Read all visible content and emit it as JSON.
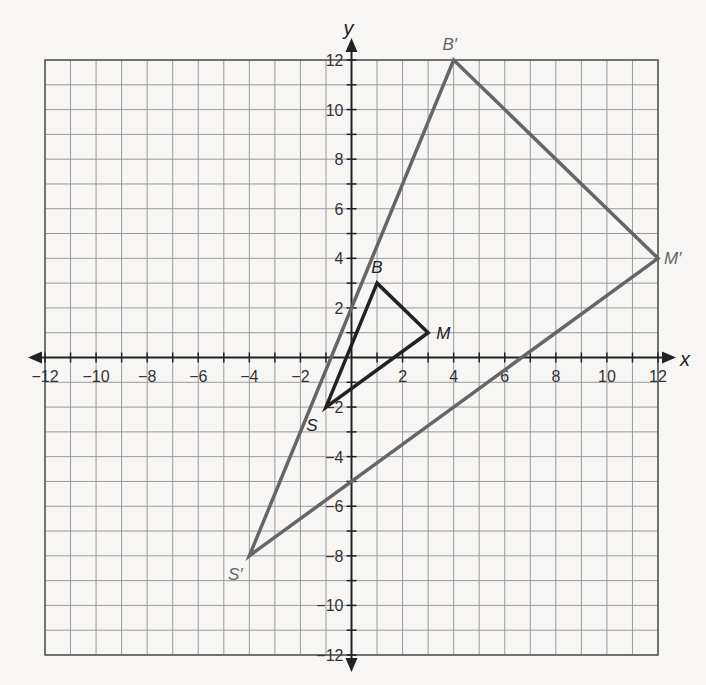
{
  "chart_data": {
    "type": "scatter",
    "title": "",
    "xlabel": "x",
    "ylabel": "y",
    "xlim": [
      -12,
      12
    ],
    "ylim": [
      -12,
      12
    ],
    "grid": true,
    "xticks": [
      -12,
      -10,
      -8,
      -6,
      -4,
      -2,
      2,
      4,
      6,
      8,
      10,
      12
    ],
    "yticks": [
      -12,
      -10,
      -8,
      -6,
      -4,
      -2,
      2,
      4,
      6,
      8,
      10,
      12
    ],
    "series": [
      {
        "name": "Triangle SBM (pre-image)",
        "color": "#222222",
        "points": [
          {
            "label": "B",
            "x": 1,
            "y": 3
          },
          {
            "label": "M",
            "x": 3,
            "y": 1
          },
          {
            "label": "S",
            "x": -1,
            "y": -2
          }
        ]
      },
      {
        "name": "Triangle S'B'M' (image, dilation factor 4 about origin)",
        "color": "#666666",
        "points": [
          {
            "label": "B′",
            "x": 4,
            "y": 12
          },
          {
            "label": "M′",
            "x": 12,
            "y": 4
          },
          {
            "label": "S′",
            "x": -4,
            "y": -8
          }
        ]
      }
    ]
  },
  "labels": {
    "x_axis": "x",
    "y_axis": "y",
    "B": "B",
    "M": "M",
    "S": "S",
    "B_prime": "B′",
    "M_prime": "M′",
    "S_prime": "S′"
  }
}
